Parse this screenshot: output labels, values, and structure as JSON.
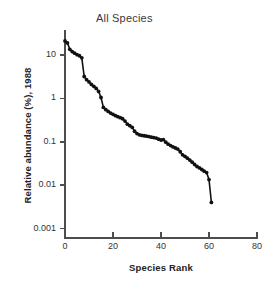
{
  "chart_data": {
    "type": "line",
    "title": "All Species",
    "xlabel": "Species Rank",
    "ylabel": "Relative abundance (%), 1988",
    "yscale": "log",
    "xlim": [
      0,
      80
    ],
    "ylim": [
      0.001,
      40
    ],
    "grid": false,
    "legend": "none",
    "marker": "filled-circle",
    "series_name": "All Species",
    "x_ticks": [
      "0",
      "20",
      "40",
      "60",
      "80"
    ],
    "x_tick_values": [
      0,
      20,
      40,
      60,
      80
    ],
    "y_ticks": [
      "10",
      "1",
      "0.1",
      "0.01",
      "0.001"
    ],
    "y_tick_values": [
      10,
      1,
      0.1,
      0.01,
      0.001
    ],
    "x": [
      0,
      1,
      2,
      3,
      4,
      5,
      6,
      7,
      8,
      9,
      10,
      11,
      12,
      13,
      14,
      15,
      16,
      17,
      18,
      19,
      20,
      21,
      22,
      23,
      24,
      25,
      26,
      27,
      28,
      29,
      30,
      31,
      32,
      33,
      34,
      35,
      36,
      37,
      38,
      39,
      40,
      41,
      42,
      43,
      44,
      45,
      46,
      47,
      48,
      49,
      50,
      51,
      52,
      53,
      54,
      55,
      56,
      57,
      58,
      59,
      60,
      61
    ],
    "values": [
      21.0,
      19.0,
      13.5,
      12.0,
      11.0,
      10.2,
      9.6,
      8.6,
      3.2,
      2.7,
      2.4,
      2.1,
      1.9,
      1.7,
      1.45,
      1.05,
      0.62,
      0.55,
      0.5,
      0.46,
      0.43,
      0.4,
      0.38,
      0.36,
      0.34,
      0.3,
      0.255,
      0.235,
      0.215,
      0.175,
      0.155,
      0.145,
      0.14,
      0.138,
      0.135,
      0.132,
      0.128,
      0.125,
      0.122,
      0.115,
      0.11,
      0.112,
      0.098,
      0.088,
      0.082,
      0.076,
      0.072,
      0.068,
      0.059,
      0.05,
      0.046,
      0.042,
      0.038,
      0.034,
      0.03,
      0.027,
      0.025,
      0.023,
      0.021,
      0.0195,
      0.0135,
      0.004
    ]
  }
}
